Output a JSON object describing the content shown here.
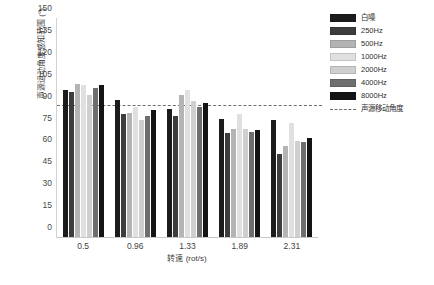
{
  "chart_data": {
    "type": "bar",
    "title": "",
    "xlabel": "转速 (rot/s)",
    "ylabel": "声源运动角度感知范围 (°)",
    "categories": [
      "0.5",
      "0.96",
      "1.33",
      "1.89",
      "2.31"
    ],
    "ylim": [
      0,
      150
    ],
    "yticks": [
      0,
      15,
      30,
      45,
      60,
      75,
      90,
      105,
      120,
      135,
      150
    ],
    "grid": false,
    "legend_position": "right",
    "series": [
      {
        "name": "白噪",
        "color": "#1c1c1c",
        "values": [
          101,
          94,
          88,
          81,
          80
        ]
      },
      {
        "name": "250Hz",
        "color": "#3d3d3d",
        "values": [
          99,
          84,
          83,
          71,
          57
        ]
      },
      {
        "name": "500Hz",
        "color": "#b4b4b4",
        "values": [
          105,
          85,
          97,
          74,
          62
        ]
      },
      {
        "name": "1000Hz",
        "color": "#e0e0e0",
        "values": [
          104,
          89,
          101,
          84,
          78
        ]
      },
      {
        "name": "2000Hz",
        "color": "#cfcfcf",
        "values": [
          97,
          80,
          93,
          74,
          66
        ]
      },
      {
        "name": "4000Hz",
        "color": "#6e6e6e",
        "values": [
          102,
          83,
          89,
          72,
          65
        ]
      },
      {
        "name": "8000Hz",
        "color": "#141414",
        "values": [
          104,
          87,
          92,
          73,
          68
        ]
      }
    ],
    "reference_line": {
      "label": "声源移动角度",
      "value": 90,
      "style": "dashed",
      "color": "#6e6e6e"
    }
  }
}
